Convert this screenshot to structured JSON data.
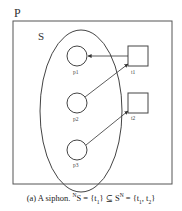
{
  "diagram": {
    "outer_label": "P",
    "set_label": "S",
    "places": [
      {
        "id": "p1",
        "label": "p1"
      },
      {
        "id": "p2",
        "label": "p2"
      },
      {
        "id": "p3",
        "label": "p3"
      }
    ],
    "transitions": [
      {
        "id": "t1",
        "label": "t1"
      },
      {
        "id": "t2",
        "label": "t2"
      }
    ],
    "arcs": [
      {
        "from": "t1",
        "to": "p1"
      },
      {
        "from": "p2",
        "to": "t1"
      },
      {
        "from": "p3",
        "to": "t2"
      }
    ]
  },
  "caption": {
    "prefix": "(a) A siphon. ",
    "sup1": "N",
    "part1": "S = {t",
    "sub1": "1",
    "part2": "} ⊆ S",
    "sup2": "N",
    "part3": " = {t",
    "sub2": "1",
    "part4": ", t",
    "sub3": "2",
    "part5": "}"
  }
}
